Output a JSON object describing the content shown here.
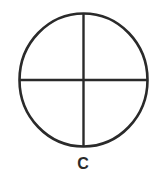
{
  "diagram": {
    "label": "C",
    "shape": "circle divided into four quadrants by a vertical and horizontal line",
    "stroke_color": "#2a2a2a"
  }
}
